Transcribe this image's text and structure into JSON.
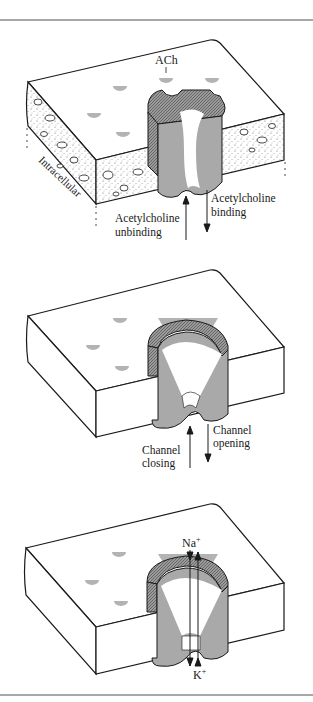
{
  "figure": {
    "colors": {
      "outline": "#1a1a1a",
      "channel_gray": "#a9a9a9",
      "ach_gray": "#b3b3b3",
      "rim_dark": "#7a7a7a",
      "rule": "#8a8a8a",
      "background": "#ffffff"
    },
    "panels": [
      {
        "id": "bound-open-prep",
        "state": "ACh bound, channel closed",
        "labels": {
          "ach": "ACh",
          "side": "Intracellular",
          "arrow_up": [
            "Acetylcholine",
            "unbinding"
          ],
          "arrow_down": [
            "Acetylcholine",
            "binding"
          ]
        }
      },
      {
        "id": "bound-closed",
        "state": "ACh bound, channel closed (conformation change)",
        "labels": {
          "arrow_up": [
            "Channel",
            "closing"
          ],
          "arrow_down": [
            "Channel",
            "opening"
          ]
        }
      },
      {
        "id": "open",
        "state": "Channel open, ion flow",
        "labels": {
          "ion_top": "Na",
          "ion_top_sup": "+",
          "ion_bottom": "K",
          "ion_bottom_sup": "+"
        }
      }
    ]
  }
}
